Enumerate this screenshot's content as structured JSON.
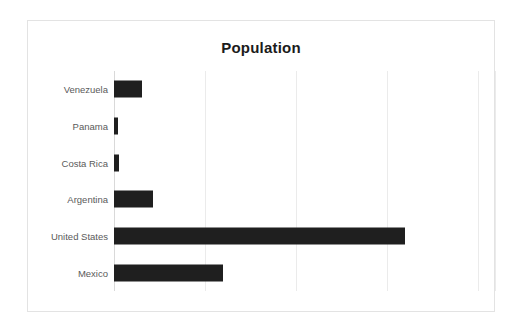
{
  "chart_data": {
    "type": "bar",
    "orientation": "horizontal",
    "title": "Population",
    "xlabel": "",
    "ylabel": "",
    "categories": [
      "Venezuela",
      "Panama",
      "Costa Rica",
      "Argentina",
      "United States",
      "Mexico"
    ],
    "values": [
      31,
      4,
      5,
      43,
      320,
      120
    ],
    "xlim": [
      0,
      420
    ],
    "ylim": null,
    "grid": true,
    "gridlines_at": [
      100,
      200,
      300,
      400
    ],
    "tick_labels": [],
    "legend": null,
    "legend_position": "none",
    "annotations": [],
    "series": [
      {
        "name": "Population",
        "values": [
          31,
          4,
          5,
          43,
          320,
          120
        ],
        "color": "#1f1f1f"
      }
    ]
  },
  "colors": {
    "bar": "#1f1f1f",
    "gridline": "#ebebeb",
    "axis": "#d9d9d9",
    "frame_border": "#e3e3e3",
    "title_text": "#1b1b1b",
    "label_text": "#5a5a5a",
    "background": "#ffffff"
  }
}
